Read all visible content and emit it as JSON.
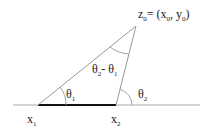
{
  "diagram": {
    "apex_label": {
      "main": "z",
      "sub": "0",
      "eq": "= (x",
      "x_sub": "0",
      "comma": ", y",
      "y_sub": "0",
      "close": ")"
    },
    "point1_label": {
      "main": "x",
      "sub": "1"
    },
    "point2_label": {
      "main": "x",
      "sub": "2"
    },
    "angle1_label": {
      "main": "θ",
      "sub": "1"
    },
    "angle2_label": {
      "main": "θ",
      "sub": "2"
    },
    "apex_angle_label": {
      "a": "θ",
      "a_sub": "2",
      "minus": "- ",
      "b": "θ",
      "b_sub": "1"
    },
    "colors": {
      "line": "#999999",
      "thick_segment": "#111111",
      "text": "#222222"
    }
  }
}
